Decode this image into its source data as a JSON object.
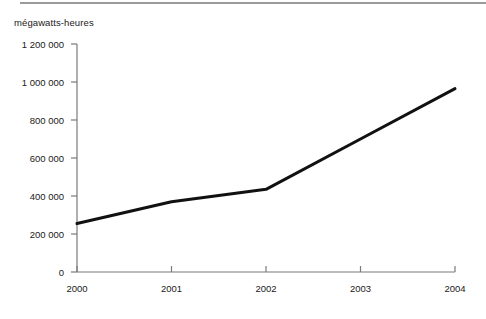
{
  "chart_data": {
    "type": "line",
    "title": "",
    "ylabel": "mégawatts-heures",
    "xlabel": "",
    "categories": [
      "2000",
      "2001",
      "2002",
      "2003",
      "2004"
    ],
    "x": [
      2000,
      2001,
      2002,
      2003,
      2004
    ],
    "values": [
      255000,
      370000,
      435000,
      700000,
      965000
    ],
    "series": [
      {
        "name": "mégawatts-heures",
        "values": [
          255000,
          370000,
          435000,
          700000,
          965000
        ]
      }
    ],
    "ylim": [
      0,
      1200000
    ],
    "xlim": [
      2000,
      2004
    ],
    "yticks": [
      0,
      200000,
      400000,
      600000,
      800000,
      1000000,
      1200000
    ],
    "ytick_labels": [
      "0",
      "200 000",
      "400 000",
      "600 000",
      "800 000",
      "1 000 000",
      "1 200 000"
    ],
    "xticks": [
      2000,
      2001,
      2002,
      2003,
      2004
    ],
    "xtick_labels": [
      "2000",
      "2001",
      "2002",
      "2003",
      "2004"
    ],
    "grid": false,
    "legend": false,
    "legend_position": "none",
    "line_color": "#111111",
    "axis_color": "#7a7a7a",
    "rule_color": "#9a9a9a",
    "background": "#ffffff",
    "annotations": []
  }
}
